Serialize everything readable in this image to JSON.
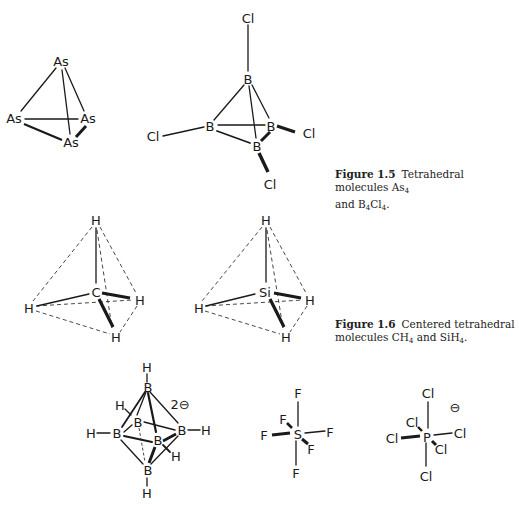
{
  "figure_1_5": {
    "label": "Figure 1.5",
    "caption_line1": "Tetrahedral molecules As",
    "caption_sub1": "4",
    "caption_line2_prefix": "and B",
    "caption_sub2": "4",
    "caption_mid": "Cl",
    "caption_sub3": "4",
    "caption_end": ".",
    "molecules": [
      {
        "name": "As4",
        "atoms": {
          "top": "As",
          "left": "As",
          "right": "As",
          "front": "As"
        }
      },
      {
        "name": "B4Cl4",
        "atoms": {
          "b_top": "B",
          "b_left": "B",
          "b_right": "B",
          "b_front": "B",
          "cl_top": "Cl",
          "cl_left": "Cl",
          "cl_right": "Cl",
          "cl_bottom": "Cl"
        }
      }
    ]
  },
  "figure_1_6": {
    "label": "Figure 1.6",
    "caption_line1": "Centered tetrahedral",
    "caption_line2_prefix": "molecules CH",
    "caption_sub1": "4",
    "caption_mid": " and SiH",
    "caption_sub2": "4",
    "caption_end": ".",
    "molecules": [
      {
        "name": "CH4",
        "atoms": {
          "center": "C",
          "top": "H",
          "left": "H",
          "right": "H",
          "front": "H"
        }
      },
      {
        "name": "SiH4",
        "atoms": {
          "center": "Si",
          "top": "H",
          "left": "H",
          "right": "H",
          "front": "H"
        }
      }
    ]
  },
  "bottom_row": {
    "molecules": [
      {
        "name": "B6H6 2-",
        "charge": "2⊖",
        "atoms": {
          "b_top": "B",
          "b_bottom": "B",
          "b_left": "B",
          "b_right": "B",
          "b_back": "B",
          "b_front": "B",
          "h_top": "H",
          "h_bottom": "H",
          "h_left": "H",
          "h_right": "H",
          "h_back": "H",
          "h_front": "H"
        }
      },
      {
        "name": "SF6",
        "atoms": {
          "center": "S",
          "top": "F",
          "bottom": "F",
          "left": "F",
          "right": "F",
          "back": "F",
          "front": "F"
        }
      },
      {
        "name": "PCl6-",
        "charge": "⊖",
        "atoms": {
          "center": "P",
          "top": "Cl",
          "bottom": "Cl",
          "left": "Cl",
          "right": "Cl",
          "back": "Cl",
          "front": "Cl"
        }
      }
    ]
  }
}
